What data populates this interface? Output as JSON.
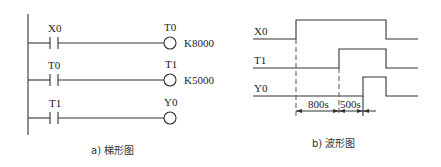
{
  "ladder": {
    "caption": "a) 梯形图",
    "rungs": [
      {
        "contact": "X0",
        "coil": "T0",
        "setting": "K8000"
      },
      {
        "contact": "T0",
        "coil": "T1",
        "setting": "K5000"
      },
      {
        "contact": "T1",
        "coil": "Y0",
        "setting": ""
      }
    ]
  },
  "waveform": {
    "caption": "b) 波形图",
    "signals": [
      {
        "name": "X0"
      },
      {
        "name": "T1"
      },
      {
        "name": "Y0"
      }
    ],
    "intervals": [
      {
        "label": "800s"
      },
      {
        "label": "500s"
      }
    ]
  }
}
